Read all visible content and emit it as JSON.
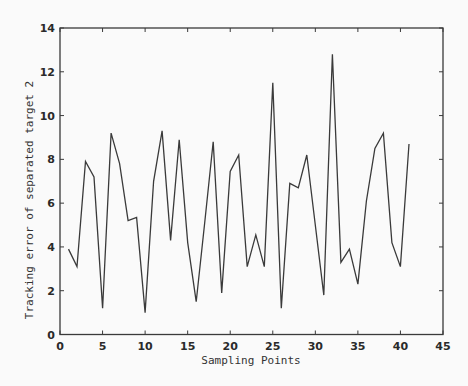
{
  "chart_data": {
    "type": "line",
    "title": "",
    "xlabel": "Sampling Points",
    "ylabel": "Tracking error of separated target 2",
    "xlim": [
      0,
      45
    ],
    "ylim": [
      0,
      14
    ],
    "xticks": [
      0,
      5,
      10,
      15,
      20,
      25,
      30,
      35,
      40,
      45
    ],
    "yticks": [
      0,
      2,
      4,
      6,
      8,
      10,
      12,
      14
    ],
    "grid": false,
    "legend": null,
    "series": [
      {
        "name": "Tracking error",
        "color": "#3a3a3a",
        "x": [
          1,
          2,
          3,
          4,
          5,
          6,
          7,
          8,
          9,
          10,
          11,
          12,
          13,
          14,
          15,
          16,
          17,
          18,
          19,
          20,
          21,
          22,
          23,
          24,
          25,
          26,
          27,
          28,
          29,
          30,
          31,
          32,
          33,
          34,
          35,
          36,
          37,
          38,
          39,
          40,
          41
        ],
        "values": [
          3.9,
          3.1,
          7.9,
          7.2,
          1.2,
          9.2,
          7.8,
          5.2,
          5.35,
          1.0,
          7.0,
          9.3,
          4.3,
          8.9,
          4.2,
          1.5,
          5.1,
          8.8,
          1.9,
          7.45,
          8.2,
          3.1,
          4.55,
          3.1,
          11.5,
          1.2,
          6.9,
          6.7,
          8.2,
          5.0,
          1.8,
          12.8,
          3.3,
          3.9,
          2.3,
          6.1,
          8.5,
          9.2,
          4.2,
          3.1,
          8.7
        ]
      }
    ]
  },
  "colors": {
    "background": "#fafafa",
    "axes": "#3a3a3a",
    "line": "#3a3a3a"
  }
}
